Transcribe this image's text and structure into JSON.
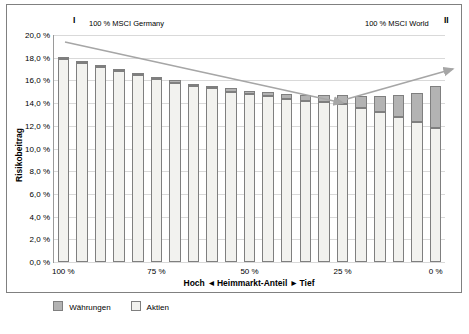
{
  "chart_data": {
    "type": "bar",
    "title": "",
    "xlabel": "Heimmarkt-Anteil",
    "ylabel": "Risikobeitrag",
    "ylim": [
      0,
      20
    ],
    "ytick_labels": [
      "20,0 %",
      "18,0 %",
      "16,0 %",
      "14,0 %",
      "12,0 %",
      "10,0 %",
      "8,0 %",
      "6,0 %",
      "4,0 %",
      "2,0 %",
      "0,0 %"
    ],
    "ytick_values": [
      20,
      18,
      16,
      14,
      12,
      10,
      8,
      6,
      4,
      2,
      0
    ],
    "xtick_labels": [
      "100 %",
      "75 %",
      "50 %",
      "25 %",
      "0 %"
    ],
    "xtick_positions": [
      0,
      5,
      10,
      15,
      20
    ],
    "categories": [
      "100",
      "95",
      "90",
      "85",
      "80",
      "75",
      "70",
      "65",
      "60",
      "55",
      "50",
      "45",
      "40",
      "35",
      "30",
      "25",
      "20",
      "15",
      "10",
      "5",
      "0"
    ],
    "grid": true,
    "legend_position": "bottom-left",
    "series": [
      {
        "name": "Aktien",
        "color": "#f2f2ef",
        "values": [
          17.9,
          17.5,
          17.2,
          16.8,
          16.5,
          16.1,
          15.8,
          15.5,
          15.3,
          15.0,
          14.8,
          14.6,
          14.4,
          14.2,
          14.1,
          13.9,
          13.6,
          13.2,
          12.8,
          12.3,
          11.8
        ]
      },
      {
        "name": "Währungen",
        "color": "#b3b3b3",
        "values": [
          0.1,
          0.1,
          0.1,
          0.1,
          0.1,
          0.2,
          0.2,
          0.2,
          0.2,
          0.3,
          0.3,
          0.4,
          0.4,
          0.5,
          0.6,
          0.8,
          1.0,
          1.4,
          1.9,
          2.6,
          3.7
        ]
      }
    ],
    "annotations": [
      {
        "name": "marker-I",
        "text": "I"
      },
      {
        "name": "marker-II",
        "text": "II"
      },
      {
        "name": "caption-left",
        "text": "100 % MSCI Germany"
      },
      {
        "name": "caption-right",
        "text": "100 % MSCI World"
      },
      {
        "name": "axis-direction-left",
        "text": "Hoch"
      },
      {
        "name": "axis-direction-right",
        "text": "Tief"
      }
    ]
  },
  "legend": {
    "items": [
      {
        "label": "Währungen",
        "color": "#b3b3b3"
      },
      {
        "label": "Aktien",
        "color": "#f2f2ef"
      }
    ]
  },
  "axis": {
    "x_caption_left": "Hoch",
    "x_caption_center": "Heimmarkt-Anteil",
    "x_caption_right": "Tief",
    "arrow_left": "◄",
    "arrow_right": "►"
  }
}
